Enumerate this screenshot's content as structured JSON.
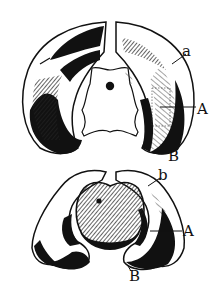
{
  "figure": {
    "top_view": {
      "labels": [
        {
          "id": "a",
          "text": "a",
          "x": 182,
          "y": 46
        },
        {
          "id": "A",
          "text": "A",
          "x": 197,
          "y": 104
        },
        {
          "id": "B",
          "text": "B",
          "x": 168,
          "y": 151
        }
      ]
    },
    "bottom_view": {
      "labels": [
        {
          "id": "b",
          "text": "b",
          "x": 158,
          "y": 170
        },
        {
          "id": "A",
          "text": "A",
          "x": 182,
          "y": 226
        },
        {
          "id": "B",
          "text": "B",
          "x": 130,
          "y": 270
        }
      ]
    },
    "colors": {
      "ink": "#111111",
      "paper": "#ffffff",
      "hatch": "#444444"
    }
  }
}
